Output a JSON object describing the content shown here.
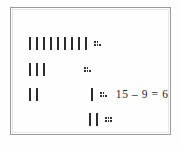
{
  "figure": {
    "kind": "tally-mark-subtraction-diagram",
    "border_color": "#9a9a9a",
    "ink_color": "#2c2c2c",
    "background": "#fefefe",
    "equation": "15 – 9 = 6",
    "rows": [
      {
        "id": "row-1",
        "strokes": 9,
        "dot_cluster": "::.",
        "dot_columns": [
          2,
          2,
          1
        ],
        "leading_space": 0,
        "has_equation": false
      },
      {
        "id": "row-2",
        "strokes": 3,
        "dot_cluster": "::.",
        "dot_columns": [
          2,
          2,
          1
        ],
        "leading_space": 32,
        "has_equation": false
      },
      {
        "id": "row-3",
        "strokes": 2,
        "dot_cluster": "::.",
        "dot_columns": [
          2,
          2,
          1
        ],
        "leading_space": 48,
        "extra_strokes_after_space": 1,
        "has_equation": true
      },
      {
        "id": "row-4",
        "strokes": 2,
        "dot_cluster": ":::",
        "dot_columns": [
          2,
          2,
          2
        ],
        "leading_space": 60,
        "has_equation": false
      }
    ]
  }
}
